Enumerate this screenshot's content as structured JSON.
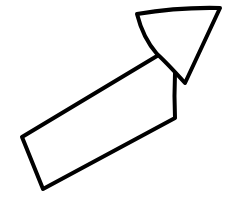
{
  "diagram": {
    "type": "hand-drawn-arrow",
    "direction": "up-right",
    "stroke_color": "#000000",
    "fill_color": "#ffffff",
    "background": "#ffffff",
    "stroke_width": 4,
    "label": "Arrow pointing up-right"
  }
}
